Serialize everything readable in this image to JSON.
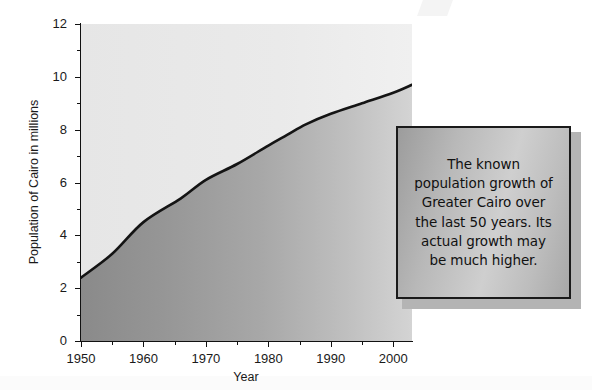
{
  "chart_data": {
    "type": "area",
    "title": "",
    "subtitle": "",
    "xlabel": "Year",
    "ylabel": "Population of Cairo in millions",
    "xlim": [
      1950,
      2003
    ],
    "ylim": [
      0,
      12
    ],
    "grid": false,
    "legend": null,
    "x_ticks": [
      1950,
      1960,
      1970,
      1980,
      1990,
      2000
    ],
    "x_tick_labels": [
      "1950",
      "1960",
      "1970",
      "1980",
      "1990",
      "2000"
    ],
    "y_ticks": [
      0,
      2,
      4,
      6,
      8,
      10,
      12
    ],
    "y_tick_labels": [
      "0",
      "2",
      "4",
      "6",
      "8",
      "10",
      "12"
    ],
    "y_minor_ticks": [
      1,
      3,
      5,
      7,
      9,
      11
    ],
    "series": [
      {
        "name": "Population of Greater Cairo",
        "x": [
          1950,
          1955,
          1960,
          1966,
          1970,
          1975,
          1980,
          1983,
          1986,
          1990,
          1995,
          2000,
          2003
        ],
        "values": [
          2.4,
          3.3,
          4.5,
          5.4,
          6.1,
          6.7,
          7.4,
          7.8,
          8.2,
          8.6,
          9.0,
          9.4,
          9.7
        ]
      }
    ],
    "annotations": [
      {
        "name": "caption",
        "text": "The known population growth of Greater Cairo over the last 50 years. Its actual growth may be much higher."
      }
    ],
    "colors": {
      "area_fill_left": "#8d8d8d",
      "area_fill_right": "#cfcfcf",
      "plot_background": "#e9e9e9",
      "line": "#141414",
      "axis": "#111111",
      "caption_border": "#1a1a1a",
      "caption_fill": "#b9b9b9"
    }
  },
  "axis": {
    "y_title": "Population of Cairo in millions",
    "x_title": "Year"
  },
  "caption": {
    "line1": "The known",
    "line2": "population growth of",
    "line3": "Greater Cairo over",
    "line4": "the last 50 years. Its",
    "line5": "actual growth may",
    "line6": "be much higher."
  }
}
